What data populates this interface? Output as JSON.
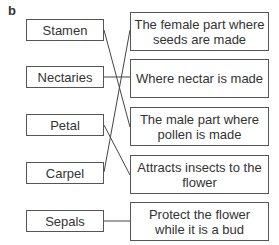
{
  "label": "b",
  "left_items": [
    "Stamen",
    "Nectaries",
    "Petal",
    "Carpel",
    "Sepals"
  ],
  "right_items": [
    "The female part where seeds are made",
    "Where nectar is made",
    "The male part where pollen is made",
    "Attracts insects to the flower",
    "Protect the flower while it is a bud"
  ],
  "connections": [
    {
      "from": "Stamen",
      "to": "The male part where pollen is made"
    },
    {
      "from": "Nectaries",
      "to": "Where nectar is made"
    },
    {
      "from": "Petal",
      "to": "Attracts insects to the flower"
    },
    {
      "from": "Carpel",
      "to": "The female part where seeds are made"
    },
    {
      "from": "Sepals",
      "to": "Protect the flower while it is a bud"
    }
  ],
  "colors": {
    "line": "#444444",
    "border": "#555555",
    "text": "#333333"
  }
}
